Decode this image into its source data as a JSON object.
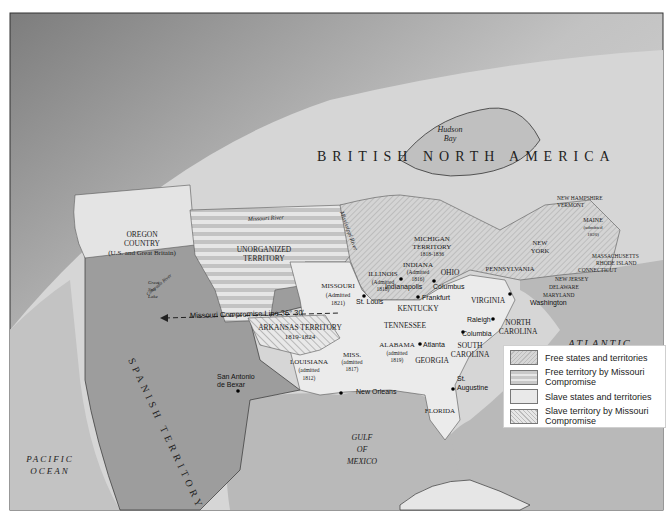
{
  "map": {
    "title_region": "BRITISH NORTH AMERICA",
    "regions": {
      "hudson_bay": [
        "Hudson",
        "Bay"
      ],
      "oregon": [
        "OREGON",
        "COUNTRY",
        "(U.S. and Great Britain)"
      ],
      "unorganized": [
        "UNORGANIZED",
        "TERRITORY"
      ],
      "missouri": [
        "MISSOURI",
        "(Admitted",
        "1821)"
      ],
      "illinois": [
        "ILLINOIS",
        "(Admitted",
        "1818)"
      ],
      "indiana": [
        "INDIANA",
        "(Admitted",
        "1816)"
      ],
      "ohio": "OHIO",
      "michigan": [
        "MICHIGAN",
        "TERRITORY",
        "1818-1836"
      ],
      "kentucky": "KENTUCKY",
      "tennessee": "TENNESSEE",
      "virginia": "VIRGINIA",
      "north_carolina": [
        "NORTH",
        "CAROLINA"
      ],
      "south_carolina": [
        "SOUTH",
        "CAROLINA"
      ],
      "georgia": "GEORGIA",
      "alabama": [
        "ALABAMA",
        "(admitted",
        "1819)"
      ],
      "mississippi": [
        "MISS.",
        "(admitted",
        "1817)"
      ],
      "louisiana": [
        "LOUISIANA",
        "(admitted",
        "1812)"
      ],
      "arkansas": [
        "ARKANSAS TERRITORY",
        "1819-1824"
      ],
      "florida": "FLORIDA",
      "pennsylvania": "PENNSYLVANIA",
      "new_york": [
        "NEW",
        "YORK"
      ],
      "new_hampshire": "NEW HAMPSHIRE",
      "vermont": "VERMONT",
      "maine": [
        "MAINE",
        "(admitted",
        "1820)"
      ],
      "massachusetts": "MASSACHUSETTS",
      "rhode_island": "RHODE ISLAND",
      "connecticut": "CONNECTICUT",
      "new_jersey": "NEW JERSEY",
      "delaware": "DELAWARE",
      "maryland": "MARYLAND",
      "spanish": "SPANISH TERRITORY",
      "great_salt_lake": [
        "Great",
        "Salt",
        "Lake"
      ],
      "atlantic": [
        "ATLANTIC",
        "OCEAN"
      ],
      "pacific": [
        "PACIFIC",
        "OCEAN"
      ],
      "gulf": [
        "GULF",
        "OF",
        "MEXICO"
      ]
    },
    "rivers": {
      "missouri_river": "Missouri River",
      "mississippi_river": "Mississippi River",
      "colorado_river": "Colorado River"
    },
    "cities": {
      "st_louis": "St. Louis",
      "indianapolis": "Indianapolis",
      "columbus": "Columbus",
      "frankfurt": "Frankfurt",
      "washington": "Washington",
      "raleigh": "Raleigh",
      "columbia": "Columbia",
      "atlanta": "Atlanta",
      "st_augustine": [
        "St.",
        "Augustine"
      ],
      "new_orleans": "New Orleans",
      "san_antonio": [
        "San Antonio",
        "de Bexar"
      ]
    },
    "compromise_line": "Missouri Compromise Line 36° 30'"
  },
  "legend": {
    "items": [
      {
        "label": "Free states and territories"
      },
      {
        "label": "Free territory by Missouri Compromise"
      },
      {
        "label": "Slave states and territories"
      },
      {
        "label": "Slave territory by Missouri Compromise"
      }
    ]
  },
  "colors": {
    "sky_dark": "#8a8a8a",
    "ocean": "#b5b5b5",
    "land_foreign": "#d9d9d9",
    "spanish": "#9e9e9e",
    "slave": "#ebebeb",
    "free_hatch": "#c4c4c4"
  }
}
